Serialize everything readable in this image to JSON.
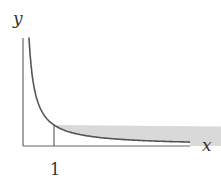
{
  "diagram": {
    "type": "function-graph-with-shaded-area",
    "function": "y = 1/x",
    "shaded_region": {
      "from_x": 1,
      "to_x": "infinity",
      "fill": "#d9d9d9"
    },
    "axes": {
      "x_label": "x",
      "y_label": "y"
    },
    "ticks": {
      "x": [
        {
          "value": 1,
          "label": "1"
        }
      ]
    },
    "colors": {
      "curve": "#555555",
      "axis": "#666666",
      "shade": "#d9d9d9",
      "text": "#333333"
    }
  }
}
